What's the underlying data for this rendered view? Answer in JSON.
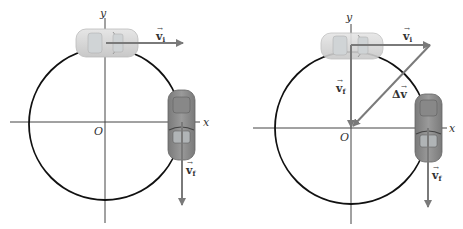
{
  "diagram": {
    "colors": {
      "circle": "#111111",
      "axes": "#444444",
      "vector": "#7a7a7a",
      "car_light": "#d8d8d8",
      "car_dark": "#8a8a8a"
    },
    "left_panel": {
      "axis_x_label": "x",
      "axis_y_label": "y",
      "origin_label": "O",
      "vectors": [
        {
          "label": "v",
          "subscript": "i",
          "direction": "right"
        },
        {
          "label": "v",
          "subscript": "f",
          "direction": "down"
        }
      ]
    },
    "right_panel": {
      "axis_x_label": "x",
      "axis_y_label": "y",
      "origin_label": "O",
      "vectors": [
        {
          "label": "v",
          "subscript": "i",
          "direction": "right"
        },
        {
          "label": "v",
          "subscript": "f",
          "direction": "down"
        },
        {
          "label": "v",
          "subscript": "f",
          "direction": "down",
          "note": "at car"
        },
        {
          "label": "Δv",
          "subscript": "",
          "direction": "down-left"
        }
      ]
    }
  }
}
